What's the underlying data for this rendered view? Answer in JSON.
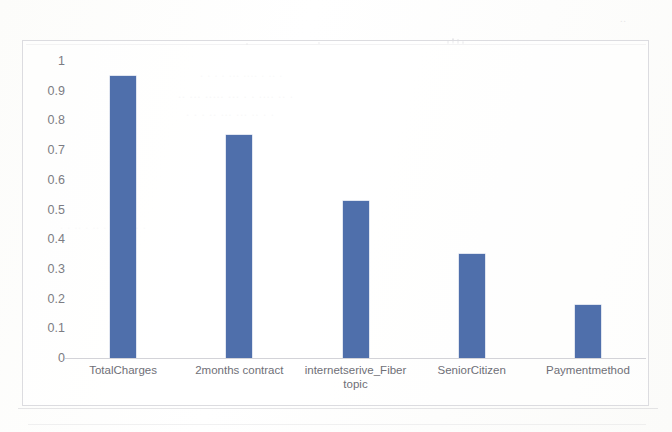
{
  "chart_data": {
    "type": "bar",
    "title": "",
    "subtitle": "",
    "xlabel": "",
    "ylabel": "",
    "categories": [
      "TotalCharges",
      "2months contract",
      "internetserive_Fiber topic",
      "SeniorCitizen",
      "Paymentmethod"
    ],
    "values": [
      0.95,
      0.75,
      0.53,
      0.35,
      0.18
    ],
    "ylim": [
      0,
      1
    ],
    "yticks": [
      "0",
      "0.1",
      "0.2",
      "0.3",
      "0.4",
      "0.5",
      "0.6",
      "0.7",
      "0.8",
      "0.9",
      "1"
    ],
    "ytick_values": [
      0,
      0.1,
      0.2,
      0.3,
      0.4,
      0.5,
      0.6,
      0.7,
      0.8,
      0.9,
      1
    ],
    "grid": false,
    "legend": false,
    "legend_position": "none",
    "series": [
      {
        "name": "",
        "values": [
          0.95,
          0.75,
          0.53,
          0.35,
          0.18
        ],
        "color": "#4f6fab"
      }
    ],
    "bar_color": "#4f6fab",
    "axis_color": "#d3d3d8",
    "tick_label_color": "#7c7c83"
  },
  "figure": {
    "border_color": "#dcdce0",
    "background": "#ffffff"
  }
}
